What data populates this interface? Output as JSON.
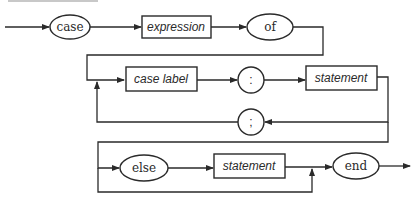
{
  "diagram": {
    "type": "syntax-diagram",
    "terminals": {
      "case": "case",
      "of": "of",
      "colon": ":",
      "semicolon": ";",
      "else": "else",
      "end": "end"
    },
    "nonterminals": {
      "expression": "expression",
      "case_label": "case label",
      "statement_1": "statement",
      "statement_2": "statement"
    },
    "colors": {
      "stroke": "#2a2a2a",
      "background": "#ffffff"
    }
  }
}
